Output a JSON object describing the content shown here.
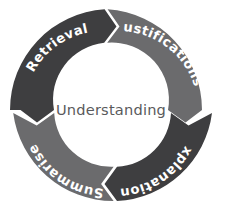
{
  "diagram": {
    "type": "cycle-ring",
    "title": "Understanding",
    "center": {
      "label": "Understanding",
      "text_color": "#5a5a5c"
    },
    "background_color": "#ffffff",
    "geometry": {
      "center_x": 111,
      "center_y": 110,
      "outer_radius": 101,
      "inner_radius": 57,
      "gap_color": "#ffffff",
      "flow_direction": "clockwise"
    },
    "colors": {
      "dark_segment": "#3e3e40",
      "light_segment": "#6b6b6d",
      "label_text": "#ffffff"
    },
    "segments": [
      {
        "id": "retrieval",
        "label": "Retrieval",
        "color": "#3e3e40",
        "tone": "dark",
        "position": "top-left",
        "order": 1,
        "text_orientation": "upright"
      },
      {
        "id": "justifications",
        "label": "Justifications",
        "color": "#6b6b6d",
        "tone": "light",
        "position": "top-right",
        "order": 2,
        "text_orientation": "upright"
      },
      {
        "id": "explanations",
        "label": "Explanations",
        "color": "#3e3e40",
        "tone": "dark",
        "position": "bottom-right",
        "order": 3,
        "text_orientation": "inverted"
      },
      {
        "id": "summarise",
        "label": "Summarise",
        "color": "#6b6b6d",
        "tone": "light",
        "position": "bottom-left",
        "order": 4,
        "text_orientation": "inverted"
      }
    ],
    "arrows": [
      {
        "id": "arrow-top",
        "between": [
          "retrieval",
          "justifications"
        ],
        "points": "clockwise"
      },
      {
        "id": "arrow-right",
        "between": [
          "justifications",
          "explanations"
        ],
        "points": "clockwise"
      },
      {
        "id": "arrow-bottom",
        "between": [
          "explanations",
          "summarise"
        ],
        "points": "clockwise"
      },
      {
        "id": "arrow-left",
        "between": [
          "summarise",
          "retrieval"
        ],
        "points": "clockwise"
      }
    ]
  }
}
